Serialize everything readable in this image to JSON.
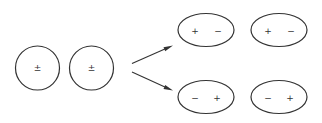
{
  "diagram": {
    "colors": {
      "stroke": "#333333",
      "background": "#ffffff"
    },
    "initial_state": {
      "circles": [
        {
          "label": "±"
        },
        {
          "label": "±"
        }
      ]
    },
    "arrows": [
      {
        "direction": "up-right"
      },
      {
        "direction": "down-right"
      }
    ],
    "outcome_top": {
      "ellipses": [
        {
          "left": "+",
          "right": "−"
        },
        {
          "left": "+",
          "right": "−"
        }
      ]
    },
    "outcome_bottom": {
      "ellipses": [
        {
          "left": "−",
          "right": "+"
        },
        {
          "left": "−",
          "right": "+"
        }
      ]
    }
  }
}
